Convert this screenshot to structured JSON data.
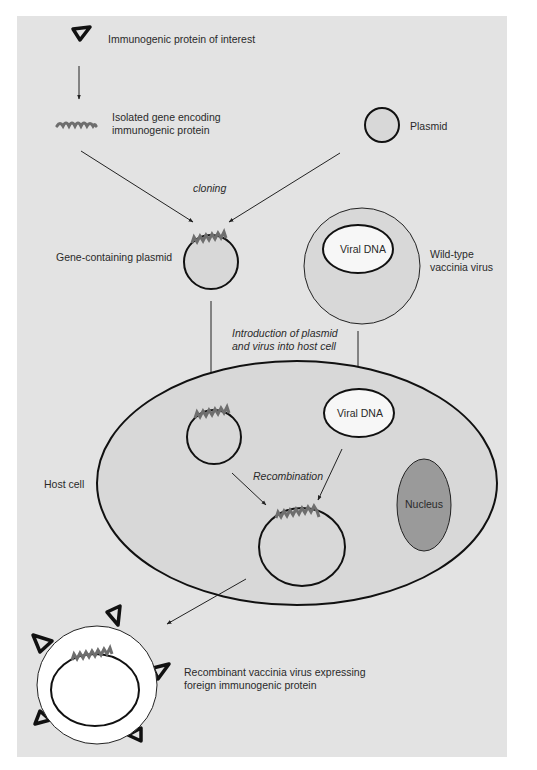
{
  "colors": {
    "panel_bg": "#e3e3e3",
    "cell_fill": "#d8d8d8",
    "nucleus_fill": "#9a9a9a",
    "gene_color": "#6e6e6e",
    "viral_dna_fill": "#f7f7f7",
    "recombinant_fill": "#ffffff",
    "outline": "#111111"
  },
  "labels": {
    "protein": "Immunogenic protein of interest",
    "gene_line1": "Isolated gene encoding",
    "gene_line2": "immunogenic protein",
    "plasmid": "Plasmid",
    "cloning": "cloning",
    "gene_plasmid": "Gene-containing plasmid",
    "wildtype_line1": "Wild-type",
    "wildtype_line2": "vaccinia virus",
    "viral_dna_virus": "Viral DNA",
    "introduction_line1": "Introduction of plasmid",
    "introduction_line2": "and virus into host cell",
    "viral_dna_cell": "Viral DNA",
    "host_cell": "Host cell",
    "recombination": "Recombination",
    "nucleus": "Nucleus",
    "recombinant_line1": "Recombinant vaccinia virus expressing",
    "recombinant_line2": "foreign immunogenic protein"
  }
}
